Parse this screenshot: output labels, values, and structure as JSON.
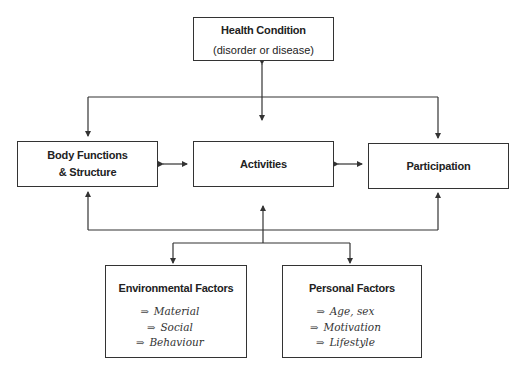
{
  "diagram": {
    "health_condition": {
      "title": "Health Condition",
      "subtitle": "(disorder or disease)"
    },
    "body_functions": {
      "line1": "Body Functions",
      "line2": "& Structure"
    },
    "activities": {
      "title": "Activities"
    },
    "participation": {
      "title": "Participation"
    },
    "environmental_factors": {
      "title": "Environmental Factors",
      "items": [
        {
          "arrow": "⇒",
          "label": "Material"
        },
        {
          "arrow": "⇒",
          "label": "Social"
        },
        {
          "arrow": "⇒",
          "label": "Behaviour"
        }
      ]
    },
    "personal_factors": {
      "title": "Personal Factors",
      "items": [
        {
          "arrow": "⇒",
          "label": "Age, sex"
        },
        {
          "arrow": "⇒",
          "label": "Motivation"
        },
        {
          "arrow": "⇒",
          "label": "Lifestyle"
        }
      ]
    }
  }
}
